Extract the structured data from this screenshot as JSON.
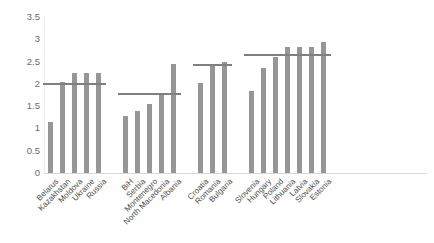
{
  "chart_data": {
    "type": "bar",
    "title": "",
    "subtitle": "",
    "xlabel": "",
    "ylabel": "",
    "ylim": [
      0,
      3.5
    ],
    "ytick_labels": [
      "0",
      "0.5",
      "1",
      "1.5",
      "2",
      "2.5",
      "3",
      "3.5"
    ],
    "ytick_values": [
      0,
      0.5,
      1,
      1.5,
      2,
      2.5,
      3,
      3.5
    ],
    "grid": false,
    "legend": null,
    "legend_position": "none",
    "categories": [
      "Belarus",
      "Kazakhstan",
      "Moldova",
      "Ukraine",
      "Russia",
      "BiH",
      "Serbia",
      "Montenegro",
      "North Macedonia",
      "Albania",
      "Croatia",
      "Romania",
      "Bulgaria",
      "Slovenia",
      "Hungary",
      "Poland",
      "Lithuania",
      "Latvia",
      "Slovakia",
      "Estonia"
    ],
    "values": [
      1.15,
      2.05,
      2.25,
      2.25,
      2.25,
      1.27,
      1.4,
      1.55,
      1.77,
      2.45,
      2.02,
      2.45,
      2.5,
      1.84,
      2.35,
      2.6,
      2.82,
      2.82,
      2.82,
      2.95
    ],
    "groups": [
      {
        "name": "group-1",
        "categories": [
          "Belarus",
          "Kazakhstan",
          "Moldova",
          "Ukraine",
          "Russia"
        ],
        "reference_line": 2.0
      },
      {
        "name": "group-2",
        "categories": [
          "BiH",
          "Serbia",
          "Montenegro",
          "North Macedonia",
          "Albania"
        ],
        "reference_line": 1.77
      },
      {
        "name": "group-3",
        "categories": [
          "Croatia",
          "Romania",
          "Bulgaria"
        ],
        "reference_line": 2.42
      },
      {
        "name": "group-4",
        "categories": [
          "Slovenia",
          "Hungary",
          "Poland",
          "Lithuania",
          "Latvia",
          "Slovakia",
          "Estonia"
        ],
        "reference_line": 2.65
      }
    ],
    "series": [
      {
        "name": "value",
        "values": [
          1.15,
          2.05,
          2.25,
          2.25,
          2.25,
          1.27,
          1.4,
          1.55,
          1.77,
          2.45,
          2.02,
          2.45,
          2.5,
          1.84,
          2.35,
          2.6,
          2.82,
          2.82,
          2.82,
          2.95
        ]
      }
    ],
    "colors": {
      "bar": "#969696",
      "reference_line": "#7f7f7f",
      "axis_text": "#6b6b6b",
      "label_text": "#4d4d4d",
      "baseline": "#d9d9d9",
      "background": "#ffffff"
    }
  }
}
